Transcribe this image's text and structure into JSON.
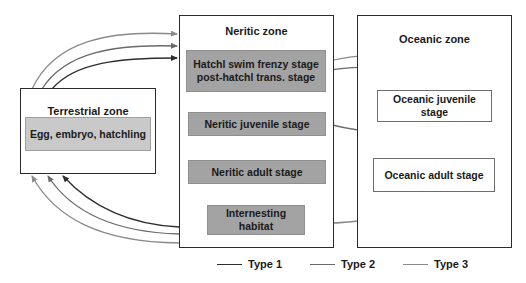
{
  "diagram": {
    "zones": {
      "terrestrial": {
        "title": "Terrestrial zone",
        "stages": [
          {
            "id": "egg",
            "label": "Egg, embryo, hatchling"
          }
        ]
      },
      "neritic": {
        "title": "Neritic zone",
        "stages": [
          {
            "id": "hatchl",
            "label_line1": "Hatchl swim frenzy stage",
            "label_line2": "post-hatchl trans. stage"
          },
          {
            "id": "neritic_juvenile",
            "label": "Neritic juvenile stage"
          },
          {
            "id": "neritic_adult",
            "label": "Neritic adult stage"
          },
          {
            "id": "internesting",
            "label_line1": "Internesting",
            "label_line2": "habitat"
          }
        ]
      },
      "oceanic": {
        "title": "Oceanic zone",
        "stages": [
          {
            "id": "oceanic_juvenile",
            "label_line1": "Oceanic juvenile",
            "label_line2": "stage"
          },
          {
            "id": "oceanic_adult",
            "label": "Oceanic adult stage"
          }
        ]
      }
    },
    "legend": [
      {
        "label": "Type 1",
        "color": "#2e2e2e"
      },
      {
        "label": "Type 2",
        "color": "#6a6a6a"
      },
      {
        "label": "Type 3",
        "color": "#8a8a8a"
      }
    ],
    "colors": {
      "type1": "#2e2e2e",
      "type2": "#6a6a6a",
      "type3": "#8a8a8a",
      "stage_fill": "#a3a3a3",
      "egg_fill": "#c9c9c9"
    }
  }
}
